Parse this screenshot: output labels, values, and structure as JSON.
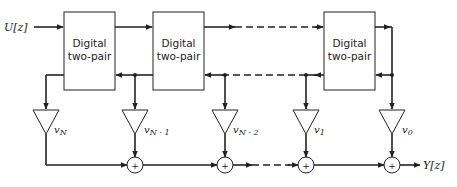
{
  "diagram": {
    "input_label": "U[z]",
    "output_label": "Y[z]",
    "blocks": [
      {
        "line1": "Digital",
        "line2": "two-pair"
      },
      {
        "line1": "Digital",
        "line2": "two-pair"
      },
      {
        "line1": "Digital",
        "line2": "two-pair"
      }
    ],
    "multipliers": [
      {
        "base": "v",
        "sub": "N"
      },
      {
        "base": "v",
        "sub": "N - 1"
      },
      {
        "base": "v",
        "sub": "N - 2"
      },
      {
        "base": "v",
        "sub": "1"
      },
      {
        "base": "v",
        "sub": "0"
      }
    ],
    "adder_symbol": "+",
    "colors": {
      "stroke": "#222222",
      "background": "#ffffff"
    }
  }
}
